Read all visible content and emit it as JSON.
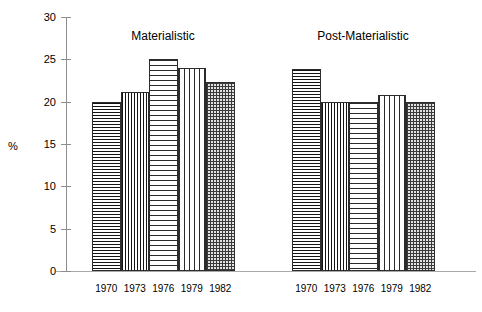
{
  "chart_data": {
    "type": "bar",
    "title": "",
    "xlabel": "",
    "ylabel": "%",
    "ylim": [
      0,
      30
    ],
    "ytick_labels": [
      "0",
      "5",
      "10",
      "15",
      "20",
      "25",
      "30"
    ],
    "ytick_values": [
      0,
      5,
      10,
      15,
      20,
      25,
      30
    ],
    "grid": false,
    "legend": "none",
    "categories": [
      "1970",
      "1973",
      "1976",
      "1979",
      "1982"
    ],
    "groups": [
      {
        "name": "Materialistic",
        "categories": [
          "1970",
          "1973",
          "1976",
          "1979",
          "1982"
        ],
        "values": [
          20,
          21.2,
          25,
          24,
          22.3
        ],
        "patterns": [
          "horizontal-dark",
          "vertical-dark",
          "horizontal-light",
          "vertical-light",
          "crosshatch"
        ]
      },
      {
        "name": "Post-Materialistic",
        "categories": [
          "1970",
          "1973",
          "1976",
          "1979",
          "1982"
        ],
        "values": [
          23.9,
          20,
          20,
          20.8,
          20
        ],
        "patterns": [
          "horizontal-dark",
          "vertical-dark",
          "horizontal-light",
          "vertical-light",
          "crosshatch"
        ]
      }
    ]
  },
  "axis": {
    "y_title": "%"
  }
}
